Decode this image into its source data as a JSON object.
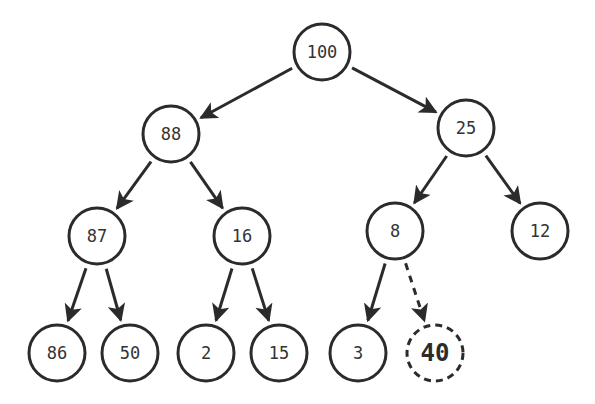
{
  "diagram": {
    "type": "binary-heap-insert",
    "node_radius": 28,
    "colors": {
      "stroke": "#2b2b2b",
      "text": "#333333",
      "fill": "#ffffff"
    },
    "nodes": [
      {
        "id": "n100",
        "label": "100",
        "x": 322,
        "y": 52
      },
      {
        "id": "n88",
        "label": "88",
        "x": 171,
        "y": 134
      },
      {
        "id": "n25",
        "label": "25",
        "x": 466,
        "y": 128
      },
      {
        "id": "n87",
        "label": "87",
        "x": 97,
        "y": 236
      },
      {
        "id": "n16",
        "label": "16",
        "x": 242,
        "y": 236
      },
      {
        "id": "n8",
        "label": "8",
        "x": 395,
        "y": 231
      },
      {
        "id": "n12",
        "label": "12",
        "x": 540,
        "y": 231
      },
      {
        "id": "n86",
        "label": "86",
        "x": 57,
        "y": 353
      },
      {
        "id": "n50",
        "label": "50",
        "x": 130,
        "y": 353
      },
      {
        "id": "n2",
        "label": "2",
        "x": 206,
        "y": 353
      },
      {
        "id": "n15",
        "label": "15",
        "x": 279,
        "y": 353
      },
      {
        "id": "n3",
        "label": "3",
        "x": 358,
        "y": 353
      },
      {
        "id": "n40",
        "label": "40",
        "x": 435,
        "y": 353,
        "dashed": true,
        "bold": true
      }
    ],
    "edges": [
      {
        "from": "n100",
        "to": "n88"
      },
      {
        "from": "n100",
        "to": "n25"
      },
      {
        "from": "n88",
        "to": "n87"
      },
      {
        "from": "n88",
        "to": "n16"
      },
      {
        "from": "n25",
        "to": "n8"
      },
      {
        "from": "n25",
        "to": "n12"
      },
      {
        "from": "n87",
        "to": "n86"
      },
      {
        "from": "n87",
        "to": "n50"
      },
      {
        "from": "n16",
        "to": "n2"
      },
      {
        "from": "n16",
        "to": "n15"
      },
      {
        "from": "n8",
        "to": "n3"
      },
      {
        "from": "n8",
        "to": "n40",
        "dashed": true
      }
    ]
  }
}
